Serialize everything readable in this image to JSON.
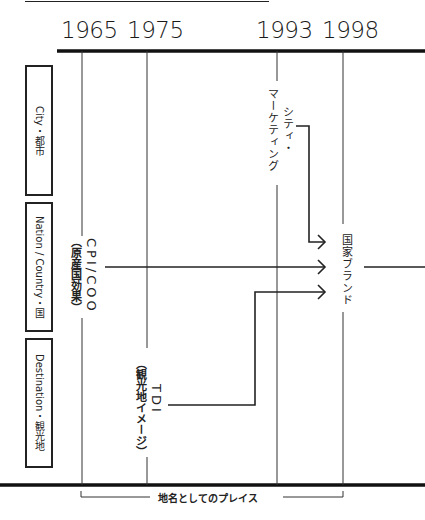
{
  "header": {
    "rule": true
  },
  "timeline": {
    "years": [
      {
        "label": "1965",
        "x": 82
      },
      {
        "label": "1975",
        "x": 147
      },
      {
        "label": "1993",
        "x": 277
      },
      {
        "label": "1998",
        "x": 343
      }
    ]
  },
  "categories": [
    {
      "label": "City・都市"
    },
    {
      "label": "Nation / Country・国"
    },
    {
      "label": "Destination・観光地"
    }
  ],
  "concepts": {
    "cpi_coo": {
      "main": "CPI/COO",
      "sub": "（原産国効果）"
    },
    "city_marketing": {
      "line1": "シティ・",
      "line2": "マーケティング"
    },
    "tdi": {
      "main": "TDI",
      "sub": "（観光地イメージ）"
    },
    "nation_brand": {
      "label": "国家ブランド"
    }
  },
  "footer": {
    "bracket_label": "地名としてのプレイス"
  },
  "colors": {
    "line": "#222222",
    "background": "#ffffff"
  }
}
